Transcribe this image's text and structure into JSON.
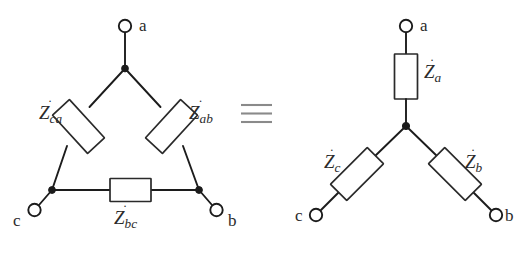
{
  "figure": {
    "equivalence_symbol": "≡",
    "colors": {
      "wire": "#1c1c1c",
      "box_stroke": "#2a2a2a",
      "box_fill": "#ffffff",
      "text": "#2b2b2b",
      "equiv_symbol": "#8a8a8a",
      "background": "#ffffff"
    },
    "delta_network": {
      "name": "delta-network",
      "terminals": [
        {
          "id": "a",
          "label": "a",
          "position": "top"
        },
        {
          "id": "b",
          "label": "b",
          "position": "bottom-right"
        },
        {
          "id": "c",
          "label": "c",
          "position": "bottom-left"
        }
      ],
      "impedances": [
        {
          "id": "Zca",
          "base": "Z",
          "dot": "˙",
          "subscript": "ca",
          "branch": "c-a"
        },
        {
          "id": "Zab",
          "base": "Z",
          "dot": "˙",
          "subscript": "ab",
          "branch": "a-b"
        },
        {
          "id": "Zbc",
          "base": "Z",
          "dot": "˙",
          "subscript": "bc",
          "branch": "b-c"
        }
      ]
    },
    "star_network": {
      "name": "star-network",
      "terminals": [
        {
          "id": "a",
          "label": "a",
          "position": "top"
        },
        {
          "id": "b",
          "label": "b",
          "position": "bottom-right"
        },
        {
          "id": "c",
          "label": "c",
          "position": "bottom-left"
        }
      ],
      "impedances": [
        {
          "id": "Za",
          "base": "Z",
          "dot": "˙",
          "subscript": "a",
          "branch": "center-a"
        },
        {
          "id": "Zb",
          "base": "Z",
          "dot": "˙",
          "subscript": "b",
          "branch": "center-b"
        },
        {
          "id": "Zc",
          "base": "Z",
          "dot": "˙",
          "subscript": "c",
          "branch": "center-c"
        }
      ]
    }
  }
}
